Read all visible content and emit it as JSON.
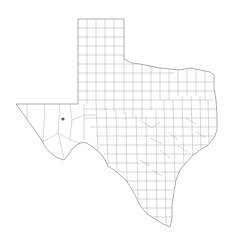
{
  "map": {
    "title": "Texas counties",
    "region": "Texas",
    "subdivision": "counties",
    "colors": {
      "background": "#ffffff",
      "border": "#8a8a8a",
      "county_lines": "#a8a8a8",
      "marker": "#555555"
    },
    "marker": {
      "label": "location-marker",
      "x": 63,
      "y": 119
    }
  }
}
